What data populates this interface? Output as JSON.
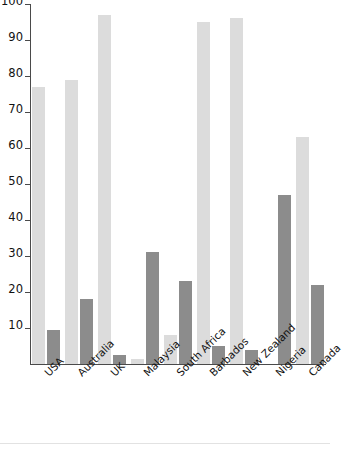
{
  "chart_data": {
    "type": "bar",
    "title": "",
    "subtitle": "",
    "xlabel": "",
    "ylabel": "",
    "ylim": [
      0,
      100
    ],
    "yticks": [
      10,
      20,
      30,
      40,
      50,
      60,
      70,
      80,
      90,
      100
    ],
    "grid": false,
    "legend": "none",
    "orientation": "vertical",
    "grouping": "grouped",
    "categories": [
      "USA",
      "Australia",
      "UK",
      "Malaysia",
      "South Africa",
      "Barbados",
      "New Zealand",
      "Nigeria",
      "Canada"
    ],
    "series": [
      {
        "name": "Series 1",
        "color": "#dcdcdc",
        "values": [
          77,
          79,
          97,
          1.5,
          8,
          95,
          96,
          0,
          63
        ]
      },
      {
        "name": "Series 2",
        "color": "#8c8c8c",
        "values": [
          9.5,
          18,
          2.5,
          31,
          23,
          5,
          4,
          47,
          22
        ]
      }
    ]
  },
  "axis": {
    "y_tick_labels": [
      "10",
      "20",
      "30",
      "40",
      "50",
      "60",
      "70",
      "80",
      "90",
      "100"
    ],
    "axis_color": "#4a4a4a"
  },
  "palette": {
    "background": "#ffffff",
    "light_bar": "#dcdcdc",
    "dark_bar": "#8c8c8c",
    "text": "#111111",
    "rule": "#e2e2e2"
  }
}
